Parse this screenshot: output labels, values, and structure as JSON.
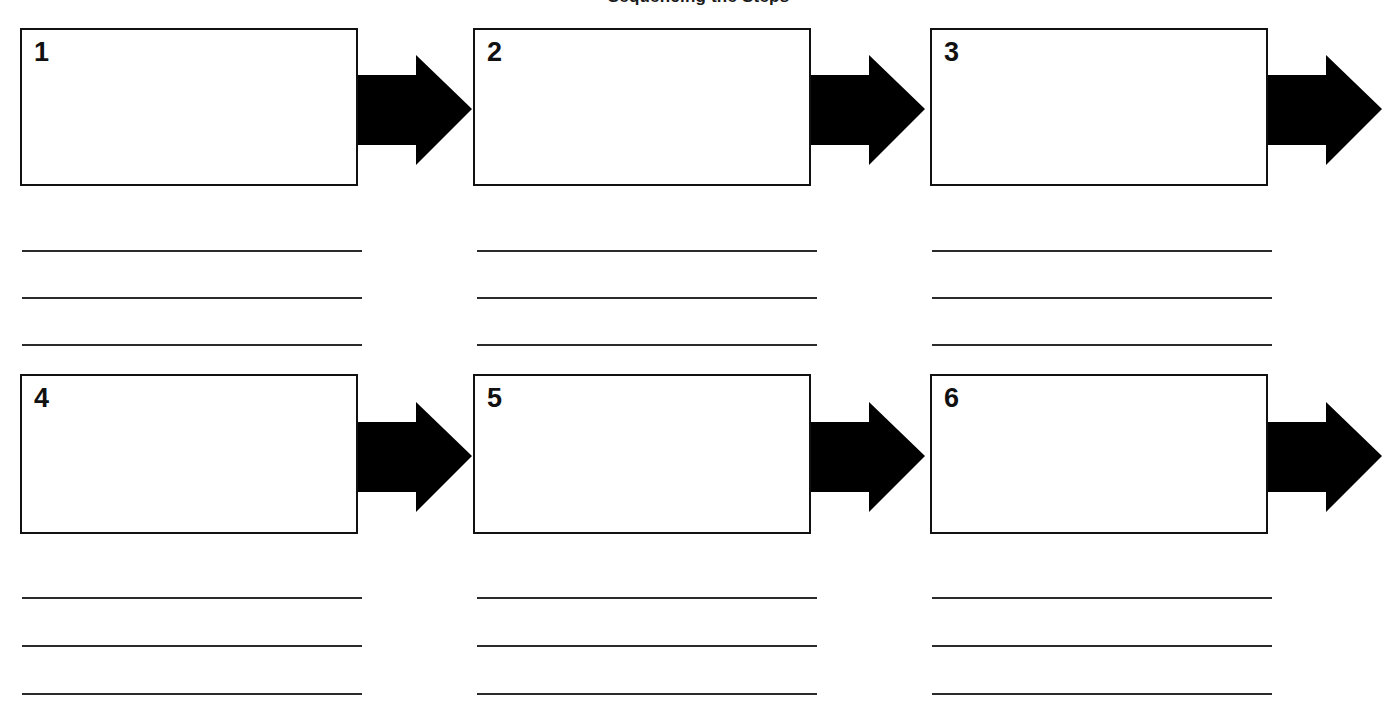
{
  "document": {
    "title": "Sequencing Worksheet",
    "clipped_heading": "Sequencing the Steps",
    "colors": {
      "ink": "#111111",
      "line": "#2b2b2b",
      "paper": "#ffffff",
      "arrow": "#000000"
    }
  },
  "steps": [
    {
      "number": "1",
      "lines": [
        "",
        "",
        ""
      ]
    },
    {
      "number": "2",
      "lines": [
        "",
        "",
        ""
      ]
    },
    {
      "number": "3",
      "lines": [
        "",
        "",
        ""
      ]
    },
    {
      "number": "4",
      "lines": [
        "",
        "",
        ""
      ]
    },
    {
      "number": "5",
      "lines": [
        "",
        "",
        ""
      ]
    },
    {
      "number": "6",
      "lines": [
        "",
        "",
        ""
      ]
    }
  ],
  "icons": {
    "arrow": "right-block-arrow-icon"
  }
}
